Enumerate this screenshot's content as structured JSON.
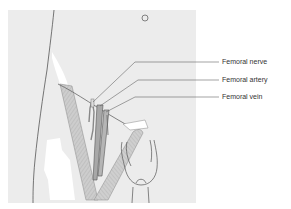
{
  "figure": {
    "labels": [
      {
        "id": "nerve",
        "text": "Femoral nerve"
      },
      {
        "id": "artery",
        "text": "Femoral artery"
      },
      {
        "id": "vein",
        "text": "Femoral vein"
      }
    ],
    "colors": {
      "background_panel": "#ececec",
      "outline": "#555555",
      "muscle_fill": "#c9c9c9",
      "vessel_fill": "#a8a8a8",
      "leader_line": "#666666",
      "label_text": "#333333"
    }
  }
}
